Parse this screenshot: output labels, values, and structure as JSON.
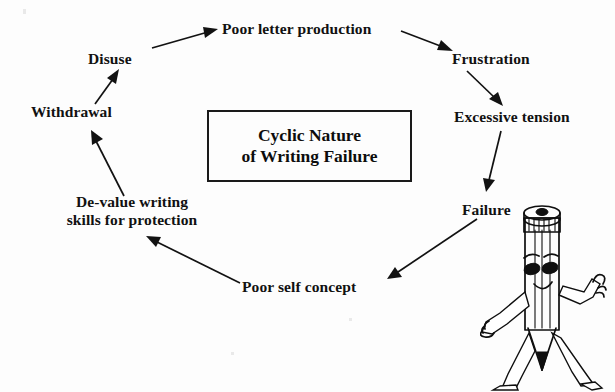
{
  "figure": {
    "kind": "cycle-diagram",
    "center_box": {
      "title_line_1": "Cyclic Nature",
      "title_line_2": "of Writing Failure"
    },
    "nodes": [
      {
        "id": "poor-letter-production",
        "label": "Poor letter production"
      },
      {
        "id": "frustration",
        "label": "Frustration"
      },
      {
        "id": "excessive-tension",
        "label": "Excessive tension"
      },
      {
        "id": "failure",
        "label": "Failure"
      },
      {
        "id": "poor-self-concept",
        "label": "Poor self concept"
      },
      {
        "id": "de-value-writing",
        "label": "De-value writing\nskills for protection"
      },
      {
        "id": "withdrawal",
        "label": "Withdrawal"
      },
      {
        "id": "disuse",
        "label": "Disuse"
      }
    ],
    "edges": [
      {
        "from": "disuse",
        "to": "poor-letter-production"
      },
      {
        "from": "poor-letter-production",
        "to": "frustration"
      },
      {
        "from": "frustration",
        "to": "excessive-tension"
      },
      {
        "from": "excessive-tension",
        "to": "failure"
      },
      {
        "from": "failure",
        "to": "poor-self-concept"
      },
      {
        "from": "poor-self-concept",
        "to": "de-value-writing"
      },
      {
        "from": "de-value-writing",
        "to": "withdrawal"
      },
      {
        "from": "withdrawal",
        "to": "disuse"
      }
    ],
    "mascot": {
      "id": "pencil-mascot",
      "description": "cartoon pencil character"
    },
    "colors": {
      "background": "#fdfdfd",
      "ink": "#121212",
      "box_border": "#1a1a1a"
    }
  }
}
